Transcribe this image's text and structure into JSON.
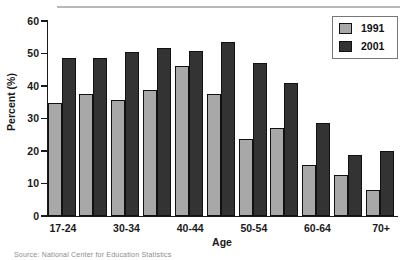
{
  "chart_data": {
    "type": "bar",
    "title": "",
    "xlabel": "Age",
    "ylabel": "Percent (%)",
    "ylim": [
      0,
      60
    ],
    "yticks": [
      0,
      10,
      20,
      30,
      40,
      50,
      60
    ],
    "grid": false,
    "legend_position": "top-right",
    "categories": [
      "17-24",
      "25-29",
      "30-34",
      "35-39",
      "40-44",
      "45-49",
      "50-54",
      "55-59",
      "60-64",
      "65-69",
      "70+"
    ],
    "visible_tick_labels": [
      "17-24",
      "30-34",
      "40-44",
      "50-54",
      "60-64",
      "70+"
    ],
    "series": [
      {
        "name": "1991",
        "color": "#a8a8a8",
        "values": [
          34.8,
          37.4,
          35.8,
          38.8,
          46.2,
          37.4,
          23.8,
          27.0,
          15.6,
          12.6,
          8.0
        ]
      },
      {
        "name": "2001",
        "color": "#333333",
        "values": [
          48.6,
          48.6,
          50.6,
          51.6,
          50.8,
          53.6,
          47.2,
          41.0,
          28.6,
          18.8,
          20.0
        ]
      }
    ]
  },
  "axes": {
    "y_label": "Percent (%)",
    "x_label": "Age",
    "y_tick_labels": [
      "60",
      "50",
      "40",
      "30",
      "20",
      "10",
      "0"
    ]
  },
  "legend": {
    "entries": [
      {
        "label": "1991",
        "color": "#a8a8a8"
      },
      {
        "label": "2001",
        "color": "#333333"
      }
    ]
  },
  "footer": {
    "source_note": "Source: National Center for Education Statistics"
  }
}
